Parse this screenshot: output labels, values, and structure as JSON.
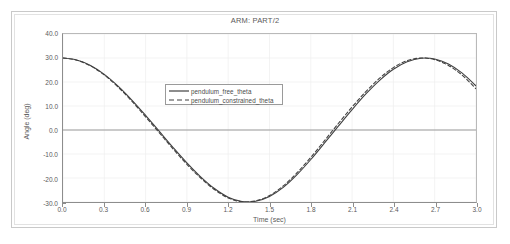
{
  "window": {
    "frame": "plot-window"
  },
  "chart_data": {
    "type": "line",
    "title": "ARM: PART/2",
    "xlabel": "Time (sec)",
    "ylabel": "Angle (deg)",
    "xlim": [
      0.0,
      3.0
    ],
    "ylim": [
      -30.0,
      40.0
    ],
    "grid": true,
    "legend_position": "center-left-upper",
    "xticks": [
      "0.0",
      "0.3",
      "0.6",
      "0.9",
      "1.2",
      "1.5",
      "1.8",
      "2.1",
      "2.4",
      "2.7",
      "3.0"
    ],
    "xtick_values": [
      0.0,
      0.3,
      0.6,
      0.9,
      1.2,
      1.5,
      1.8,
      2.1,
      2.4,
      2.7,
      3.0
    ],
    "yticks": [
      "40.0",
      "30.0",
      "20.0",
      "10.0",
      "0.0",
      "-10.0",
      "-20.0",
      "-30.0"
    ],
    "ytick_values": [
      40.0,
      30.0,
      20.0,
      10.0,
      0.0,
      -10.0,
      -20.0,
      -30.0
    ],
    "x": [
      0.0,
      0.1,
      0.2,
      0.3,
      0.4,
      0.5,
      0.6,
      0.7,
      0.8,
      0.9,
      1.0,
      1.1,
      1.2,
      1.3,
      1.4,
      1.5,
      1.6,
      1.7,
      1.8,
      1.9,
      2.0,
      2.1,
      2.2,
      2.3,
      2.4,
      2.5,
      2.6,
      2.7,
      2.8,
      2.9,
      3.0
    ],
    "series": [
      {
        "name": "pendulum_free_theta",
        "style": "solid",
        "color": "#404040",
        "values": [
          30.0,
          29.2,
          26.9,
          23.2,
          18.3,
          12.5,
          6.1,
          -0.6,
          -7.3,
          -13.7,
          -19.5,
          -24.4,
          -28.0,
          -29.8,
          -29.7,
          -27.7,
          -23.9,
          -18.6,
          -12.3,
          -5.4,
          1.6,
          8.5,
          15.0,
          20.7,
          25.3,
          28.4,
          29.9,
          29.6,
          27.5,
          23.7,
          18.4
        ]
      },
      {
        "name": "pendulum_constrained_theta",
        "style": "dashed",
        "color": "#404040",
        "values": [
          30.0,
          29.1,
          26.7,
          22.9,
          17.9,
          12.0,
          5.5,
          -1.2,
          -7.9,
          -14.3,
          -20.0,
          -24.8,
          -28.3,
          -29.9,
          -29.5,
          -27.3,
          -23.3,
          -17.8,
          -11.4,
          -4.4,
          2.7,
          9.6,
          16.0,
          21.6,
          26.0,
          28.9,
          30.0,
          29.3,
          26.9,
          22.8,
          17.2
        ]
      }
    ],
    "annotations": []
  }
}
